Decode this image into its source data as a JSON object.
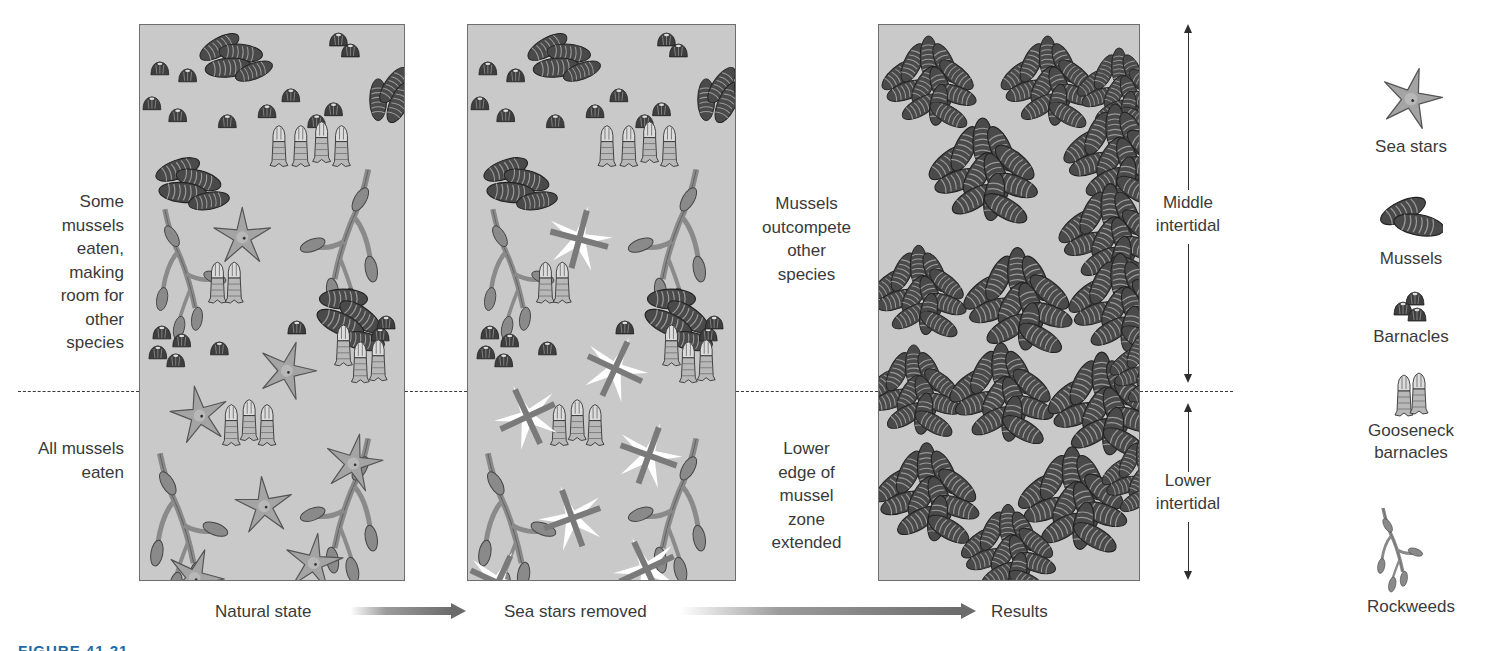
{
  "figure": {
    "caption_partial": "FIGURE 41.21"
  },
  "colors": {
    "panel_bg": "#c9c9c9",
    "panel_border": "#6e6e6e",
    "text": "#3a3a3a",
    "mussel": "#4a4a4a",
    "mussel_stripe": "#9a9a9a",
    "barnacle": "#3e3e3e",
    "star": "#a4a4a4",
    "rockweed": "#8a8a8a",
    "gooseneck": "#b8b8b8",
    "removed_star": "#ffffff",
    "removed_cross": "#7a7a7a"
  },
  "left_notes": {
    "upper": [
      "Some",
      "mussels",
      "eaten,",
      "making",
      "room for",
      "other",
      "species"
    ],
    "lower": [
      "All mussels",
      "eaten"
    ]
  },
  "middle_notes": {
    "upper": [
      "Mussels",
      "outcompete",
      "other",
      "species"
    ],
    "lower": [
      "Lower",
      "edge of",
      "mussel",
      "zone",
      "extended"
    ]
  },
  "zones": {
    "middle": [
      "Middle",
      "intertidal"
    ],
    "lower": [
      "Lower",
      "intertidal"
    ]
  },
  "steps": [
    {
      "label": "Natural state"
    },
    {
      "label": "Sea stars removed"
    },
    {
      "label": "Results"
    }
  ],
  "legend": [
    {
      "key": "sea-star",
      "label": "Sea stars"
    },
    {
      "key": "mussel",
      "label": "Mussels"
    },
    {
      "key": "barnacle",
      "label": "Barnacles"
    },
    {
      "key": "gooseneck",
      "label": [
        "Gooseneck",
        "barnacles"
      ]
    },
    {
      "key": "rockweed",
      "label": "Rockweeds"
    }
  ],
  "panels": {
    "natural_state": {
      "mussel_clusters": [
        [
          80,
          22,
          1.0,
          -10
        ],
        [
          240,
          75,
          0.95,
          -70
        ],
        [
          38,
          145,
          1.05,
          0
        ],
        [
          205,
          275,
          1.1,
          20
        ]
      ],
      "barnacles": [
        [
          20,
          45
        ],
        [
          48,
          52
        ],
        [
          12,
          80
        ],
        [
          38,
          92
        ],
        [
          88,
          98
        ],
        [
          128,
          88
        ],
        [
          152,
          72
        ],
        [
          178,
          98
        ],
        [
          195,
          86
        ],
        [
          200,
          16
        ],
        [
          212,
          27
        ],
        [
          22,
          310
        ],
        [
          42,
          318
        ],
        [
          80,
          326
        ],
        [
          158,
          305
        ],
        [
          242,
          312
        ],
        [
          248,
          300
        ],
        [
          18,
          330
        ],
        [
          36,
          338
        ]
      ],
      "goosenecks": [
        [
          140,
          125
        ],
        [
          162,
          125
        ],
        [
          183,
          121
        ],
        [
          203,
          125
        ],
        [
          78,
          262
        ],
        [
          95,
          262
        ],
        [
          205,
          325
        ],
        [
          222,
          342
        ],
        [
          240,
          340
        ],
        [
          92,
          405
        ],
        [
          110,
          400
        ],
        [
          128,
          405
        ]
      ],
      "stars": [
        [
          103,
          213,
          0
        ],
        [
          148,
          347,
          18
        ],
        [
          60,
          392,
          -10
        ],
        [
          215,
          440,
          12
        ],
        [
          125,
          483,
          -5
        ],
        [
          175,
          540,
          8
        ],
        [
          55,
          555,
          20
        ]
      ],
      "rockweeds": [
        [
          25,
          185,
          0.9,
          1
        ],
        [
          230,
          145,
          1.0,
          -1
        ],
        [
          20,
          430,
          1.0,
          1
        ],
        [
          230,
          415,
          1.0,
          -1
        ]
      ]
    },
    "sea_stars_removed": {
      "mussel_clusters": [
        [
          80,
          22,
          1.0,
          -10
        ],
        [
          240,
          75,
          0.95,
          -70
        ],
        [
          38,
          145,
          1.05,
          0
        ],
        [
          205,
          275,
          1.1,
          20
        ]
      ],
      "barnacles": [
        [
          20,
          45
        ],
        [
          48,
          52
        ],
        [
          12,
          80
        ],
        [
          38,
          92
        ],
        [
          88,
          98
        ],
        [
          128,
          88
        ],
        [
          152,
          72
        ],
        [
          178,
          98
        ],
        [
          195,
          86
        ],
        [
          200,
          16
        ],
        [
          212,
          27
        ],
        [
          22,
          310
        ],
        [
          42,
          318
        ],
        [
          80,
          326
        ],
        [
          158,
          305
        ],
        [
          242,
          312
        ],
        [
          248,
          300
        ],
        [
          18,
          330
        ],
        [
          36,
          338
        ]
      ],
      "goosenecks": [
        [
          140,
          125
        ],
        [
          162,
          125
        ],
        [
          183,
          121
        ],
        [
          203,
          125
        ],
        [
          78,
          262
        ],
        [
          95,
          262
        ],
        [
          205,
          325
        ],
        [
          222,
          342
        ],
        [
          240,
          340
        ],
        [
          92,
          405
        ],
        [
          110,
          400
        ],
        [
          128,
          405
        ]
      ],
      "removed_stars": [
        [
          112,
          215,
          15
        ],
        [
          148,
          345,
          25
        ],
        [
          60,
          393,
          -25
        ],
        [
          182,
          432,
          20
        ],
        [
          105,
          495,
          -20
        ],
        [
          180,
          546,
          -25
        ],
        [
          30,
          560,
          25
        ]
      ],
      "rockweeds": [
        [
          25,
          185,
          0.9,
          1
        ],
        [
          230,
          145,
          1.0,
          -1
        ],
        [
          20,
          430,
          1.0,
          1
        ],
        [
          230,
          415,
          1.0,
          -1
        ]
      ]
    },
    "results": {
      "mussel_beds": [
        [
          20,
          30,
          1.0
        ],
        [
          140,
          30,
          1.0
        ],
        [
          215,
          40,
          0.9
        ],
        [
          70,
          115,
          1.15
        ],
        [
          205,
          100,
          1.1
        ],
        [
          200,
          180,
          1.1
        ],
        [
          10,
          240,
          1.0
        ],
        [
          105,
          245,
          1.15
        ],
        [
          210,
          250,
          1.1
        ],
        [
          5,
          340,
          1.0
        ],
        [
          90,
          340,
          1.1
        ],
        [
          190,
          350,
          1.15
        ],
        [
          248,
          320,
          0.9
        ],
        [
          15,
          440,
          1.1
        ],
        [
          160,
          445,
          1.15
        ],
        [
          100,
          500,
          1.0
        ],
        [
          240,
          430,
          0.9
        ]
      ]
    }
  }
}
